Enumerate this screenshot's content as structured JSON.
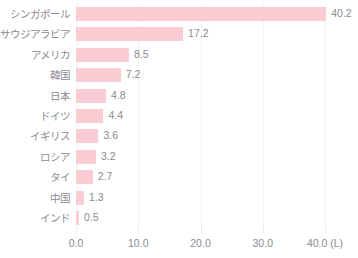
{
  "chart_data": {
    "type": "bar",
    "orientation": "horizontal",
    "title": "",
    "subtitle": "",
    "xlabel": "",
    "ylabel": "",
    "xlim": [
      0.0,
      40.0
    ],
    "grid": true,
    "legend": false,
    "unit_label": "(L)",
    "bar_color": "#f9cdd3",
    "text_color": "#8b8b90",
    "gridline_color": "#f2f2f4",
    "background": "#ffffff",
    "categories": [
      "シンガポール",
      "サウジアラビア",
      "アメリカ",
      "韓国",
      "日本",
      "ドイツ",
      "イギリス",
      "ロシア",
      "タイ",
      "中国",
      "インド"
    ],
    "values": [
      40.2,
      17.2,
      8.5,
      7.2,
      4.8,
      4.4,
      3.6,
      3.2,
      2.7,
      1.3,
      0.5
    ],
    "value_labels": [
      "40.2",
      "17.2",
      "8.5",
      "7.2",
      "4.8",
      "4.4",
      "3.6",
      "3.2",
      "2.7",
      "1.3",
      "0.5"
    ],
    "xticks": [
      0.0,
      10.0,
      20.0,
      30.0,
      40.0
    ],
    "xtick_labels": [
      "0.0",
      "10.0",
      "20.0",
      "30.0",
      "40.0 (L)"
    ]
  }
}
